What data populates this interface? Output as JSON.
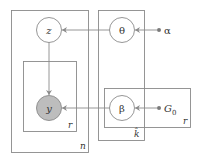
{
  "diagram": {
    "type": "plate-notation-graphical-model",
    "nodes": [
      {
        "id": "z",
        "label": "z",
        "kind": "latent"
      },
      {
        "id": "y",
        "label": "y",
        "kind": "observed"
      },
      {
        "id": "theta",
        "label": "θ",
        "kind": "latent"
      },
      {
        "id": "beta",
        "label": "β",
        "kind": "latent"
      },
      {
        "id": "alpha",
        "label": "α",
        "kind": "hyperparameter"
      },
      {
        "id": "G0",
        "label": "G",
        "sub": "0",
        "kind": "hyperparameter"
      }
    ],
    "edges": [
      {
        "from": "theta",
        "to": "z"
      },
      {
        "from": "alpha",
        "to": "theta"
      },
      {
        "from": "z",
        "to": "y"
      },
      {
        "from": "beta",
        "to": "y"
      },
      {
        "from": "G0",
        "to": "beta"
      }
    ],
    "plates": [
      {
        "id": "plate-n",
        "label": "n",
        "contains": [
          "z",
          "plate-r-left"
        ]
      },
      {
        "id": "plate-r-left",
        "label": "r",
        "contains": [
          "y"
        ]
      },
      {
        "id": "plate-k",
        "label": "k̂",
        "contains": [
          "theta",
          "beta"
        ]
      },
      {
        "id": "plate-r-right",
        "label": "r",
        "contains": [
          "beta",
          "G0"
        ]
      }
    ],
    "colors": {
      "stroke": "#8a8a8a",
      "observed_fill": "#bdbdbd",
      "text": "#333333"
    }
  }
}
